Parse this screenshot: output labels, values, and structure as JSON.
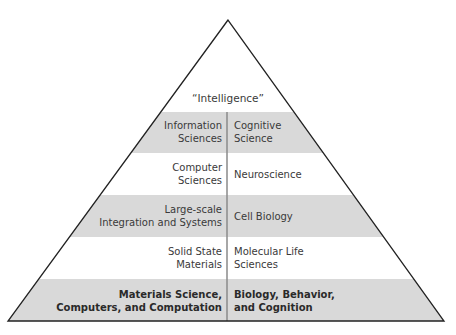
{
  "diagram": {
    "type": "pyramid",
    "apex_label": "“Intelligence”",
    "colors": {
      "band_gray": "#d9d9d9",
      "band_white": "#ffffff",
      "outline": "#222222",
      "divider": "#8a8a8a"
    },
    "tiers": [
      {
        "left": "Information\nSciences",
        "right": "Cognitive\nScience",
        "shaded": true
      },
      {
        "left": "Computer\nSciences",
        "right": "Neuroscience",
        "shaded": false
      },
      {
        "left": "Large-scale\nIntegration and Systems",
        "right": "Cell Biology",
        "shaded": true
      },
      {
        "left": "Solid State\nMaterials",
        "right": "Molecular Life\nSciences",
        "shaded": false
      },
      {
        "left": "Materials Science,\nComputers, and Computation",
        "right": "Biology, Behavior,\nand Cognition",
        "shaded": true,
        "bold": true
      }
    ]
  },
  "labels": {
    "t0l1": "Information",
    "t0l2": "Sciences",
    "t0r1": "Cognitive",
    "t0r2": "Science",
    "t1l1": "Computer",
    "t1l2": "Sciences",
    "t1r1": "Neuroscience",
    "t2l1": "Large-scale",
    "t2l2": "Integration and Systems",
    "t2r1": "Cell Biology",
    "t3l1": "Solid State",
    "t3l2": "Materials",
    "t3r1": "Molecular Life",
    "t3r2": "Sciences",
    "t4l1": "Materials Science,",
    "t4l2": "Computers, and Computation",
    "t4r1": "Biology, Behavior,",
    "t4r2": "and Cognition"
  }
}
